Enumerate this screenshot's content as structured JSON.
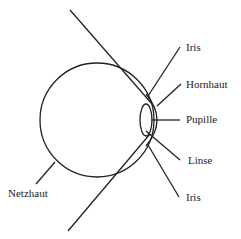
{
  "diagram": {
    "labels": {
      "iris_top": "Iris",
      "hornhaut": "Hornhaut",
      "pupille": "Pupille",
      "linse": "Linse",
      "iris_bottom": "Iris",
      "netzhaut": "Netzhaut"
    },
    "stroke_color": "#222222"
  }
}
